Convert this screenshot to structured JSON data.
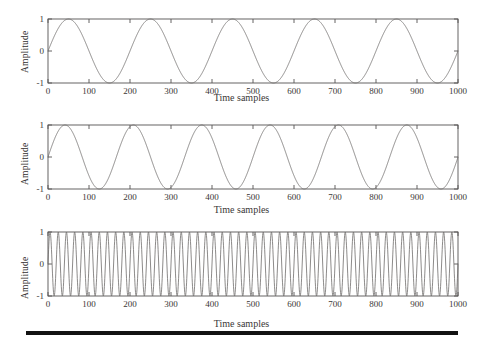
{
  "figure": {
    "background_color": "#ffffff",
    "line_color": "#6f6c6b",
    "frame_color": "#555252",
    "rule_color": "#121212"
  },
  "chart_data": [
    {
      "type": "line",
      "title": "",
      "xlabel": "Time samples",
      "ylabel": "Amplitude",
      "xlim": [
        0,
        1000
      ],
      "ylim": [
        -1,
        1
      ],
      "xticks": [
        0,
        100,
        200,
        300,
        400,
        500,
        600,
        700,
        800,
        900,
        1000
      ],
      "xtick_labels": [
        "0",
        "100",
        "200",
        "300",
        "400",
        "500",
        "600",
        "700",
        "800",
        "900",
        "1000"
      ],
      "yticks": [
        -1,
        0,
        1
      ],
      "ytick_labels": [
        "-1",
        "0",
        "1"
      ],
      "grid": false,
      "legend": "none",
      "series": [
        {
          "name": "sine 5 cycles",
          "waveform": "sine",
          "amplitude": 1,
          "period_samples": 200,
          "cycles": 5,
          "phase": 0,
          "offset": 0,
          "n_samples": 1000
        }
      ]
    },
    {
      "type": "line",
      "title": "",
      "xlabel": "Time samples",
      "ylabel": "Amplitude",
      "xlim": [
        0,
        1000
      ],
      "ylim": [
        -1,
        1
      ],
      "xticks": [
        0,
        100,
        200,
        300,
        400,
        500,
        600,
        700,
        800,
        900,
        1000
      ],
      "xtick_labels": [
        "0",
        "100",
        "200",
        "300",
        "400",
        "500",
        "600",
        "700",
        "800",
        "900",
        "1000"
      ],
      "yticks": [
        -1,
        0,
        1
      ],
      "ytick_labels": [
        "-1",
        "0",
        "1"
      ],
      "grid": false,
      "legend": "none",
      "series": [
        {
          "name": "sine 6 cycles",
          "waveform": "sine",
          "amplitude": 1,
          "period_samples": 166.7,
          "cycles": 6,
          "phase": 0,
          "offset": 0,
          "n_samples": 1000
        }
      ]
    },
    {
      "type": "line",
      "title": "",
      "xlabel": "Time samples",
      "ylabel": "Amplitude",
      "xlim": [
        0,
        1000
      ],
      "ylim": [
        -1,
        1
      ],
      "xticks": [
        0,
        100,
        200,
        300,
        400,
        500,
        600,
        700,
        800,
        900,
        1000
      ],
      "xtick_labels": [
        "0",
        "100",
        "200",
        "300",
        "400",
        "500",
        "600",
        "700",
        "800",
        "900",
        "1000"
      ],
      "yticks": [
        -1,
        0,
        1
      ],
      "ytick_labels": [
        "-1",
        "0",
        "1"
      ],
      "grid": false,
      "legend": "none",
      "series": [
        {
          "name": "sine 50 cycles",
          "waveform": "sine",
          "amplitude": 1,
          "period_samples": 20,
          "cycles": 50,
          "phase": 0,
          "offset": 0,
          "n_samples": 1000
        }
      ]
    }
  ]
}
